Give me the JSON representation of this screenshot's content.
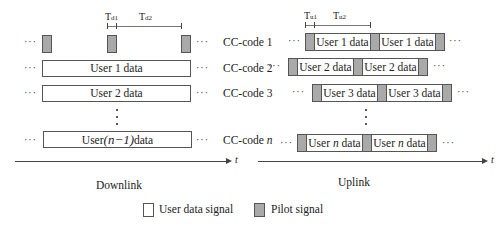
{
  "downlink": {
    "timing": {
      "t1_main": "T",
      "t1_sub": "d1",
      "t2_main": "T",
      "t2_sub": "d2"
    },
    "rows": [
      {
        "code_label": "CC-code 1",
        "content": "pilots"
      },
      {
        "code_label": "CC-code 2",
        "data_label": "User 1 data"
      },
      {
        "code_label": "CC-code 3",
        "data_label": "User 2 data"
      },
      {
        "code_label_prefix": "CC-code ",
        "code_label_var": "n",
        "data_label_prefix": "User",
        "data_label_paren": "(n−1)",
        "data_label_suffix": "data"
      }
    ],
    "axis_label": "t",
    "title": "Downlink"
  },
  "uplink": {
    "timing": {
      "t1_main": "T",
      "t1_sub": "u1",
      "t2_main": "T",
      "t2_sub": "u2"
    },
    "rows": [
      {
        "data_labels": [
          "User 1 data",
          "User 1 data"
        ]
      },
      {
        "data_labels": [
          "User 2 data",
          "User 2 data"
        ]
      },
      {
        "data_labels": [
          "User 3 data",
          "User 3 data"
        ]
      },
      {
        "data_prefix": "User ",
        "data_var": "n",
        "data_suffix": " data"
      }
    ],
    "axis_label": "t",
    "title": "Uplink"
  },
  "ellipsis": "···",
  "legend": {
    "user_data": "User data signal",
    "pilot": "Pilot signal"
  },
  "colors": {
    "pilot_fill": "#a9a9a9",
    "data_fill": "#ffffff",
    "stroke": "#555555"
  }
}
